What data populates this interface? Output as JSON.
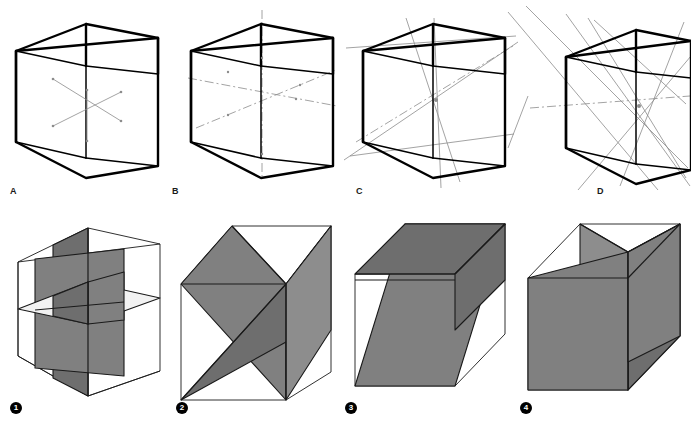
{
  "figure": {
    "background_color": "#ffffff",
    "ink_color": "#000000",
    "axis_color": "#8c8c8c",
    "plane_fill_gray": "#808080",
    "plane_fill_light": "#f2f2f2",
    "width_px": 691,
    "height_px": 421
  },
  "top_row": {
    "description": "Rotation axes of the cube",
    "panels": [
      {
        "label": "A",
        "name": "four-fold-axes-short",
        "caption": "",
        "axis_kind": "face-centre axes, drawn short inside the cube",
        "axis_count": 3,
        "line_style": "plain thin with end ticks"
      },
      {
        "label": "B",
        "name": "four-fold-axes-extended",
        "caption": "",
        "axis_kind": "face-centre axes, extended beyond the cube",
        "axis_count": 3,
        "line_style": "dash-dot"
      },
      {
        "label": "C",
        "name": "three-fold-axes",
        "caption": "",
        "axis_kind": "body diagonals through opposite corners",
        "axis_count": 4,
        "line_style": "plain thin, extended"
      },
      {
        "label": "D",
        "name": "two-fold-axes",
        "caption": "",
        "axis_kind": "axes through midpoints of opposite edges",
        "axis_count": 6,
        "line_style": "plain thin, extended"
      }
    ]
  },
  "bottom_row": {
    "description": "Mirror planes of the cube",
    "panels": [
      {
        "number": "1",
        "name": "axial-mirror-planes",
        "caption": "",
        "plane_kind": "three mutually perpendicular planes parallel to the cube faces",
        "plane_count": 3,
        "fills": [
          "#808080",
          "#808080",
          "#f2f2f2"
        ]
      },
      {
        "number": "2",
        "name": "diagonal-mirror-planes-pair-a",
        "caption": "",
        "plane_kind": "two diagonal planes through opposite edges",
        "plane_count": 2,
        "fills": [
          "#808080",
          "#6e6e6e"
        ]
      },
      {
        "number": "3",
        "name": "diagonal-and-axial-plane",
        "caption": "",
        "plane_kind": "one diagonal plane plus one horizontal axial plane",
        "plane_count": 2,
        "fills": [
          "#808080",
          "#6e6e6e"
        ]
      },
      {
        "number": "4",
        "name": "diagonal-mirror-planes-pair-b",
        "caption": "",
        "plane_kind": "two diagonal planes crossing at the vertical axis",
        "plane_count": 2,
        "fills": [
          "#808080",
          "#6e6e6e"
        ]
      }
    ]
  }
}
